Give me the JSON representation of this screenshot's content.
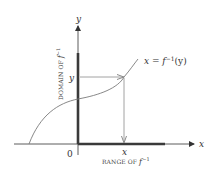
{
  "diagram": {
    "type": "inverse-function-graph",
    "axes": {
      "x_label": "x",
      "y_label": "y",
      "origin_label": "0"
    },
    "curve": {
      "label_lhs": "x = ",
      "label_func": "f",
      "label_sup": "−1",
      "label_arg": "(y)",
      "color": "#7a7a7a"
    },
    "domain_label": {
      "text": "DOMAIN OF ",
      "func": "f",
      "sup": "−1"
    },
    "range_label": {
      "text": "RANGE OF ",
      "func": "f",
      "sup": "−1"
    },
    "point_labels": {
      "y_value": "y",
      "x_value": "x"
    },
    "colors": {
      "axis": "#333333",
      "thick_bar": "#3a3a3a",
      "arrow": "#8a8a8a",
      "curve": "#7a7a7a",
      "background": "#ffffff"
    }
  }
}
